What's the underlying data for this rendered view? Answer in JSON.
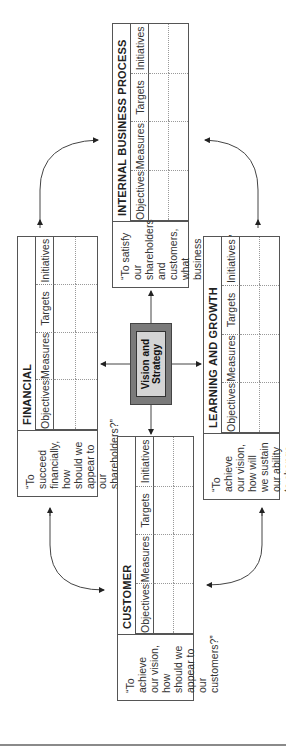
{
  "center": {
    "line1": "Vision and",
    "line2": "Strategy",
    "fill": "#7a7a7a",
    "inner_fill": "#d4d4d4"
  },
  "perspectives": {
    "financial": {
      "title": "FINANCIAL",
      "question": "“To succeed financially, how should we appear to our shareholders?”",
      "columns": [
        "Objectives",
        "Measures",
        "Targets",
        "Initiatives"
      ]
    },
    "internal": {
      "title": "INTERNAL BUSINESS PROCESS",
      "question": "“To satisfy our shareholders and customers, what business process must we excel at?”",
      "columns": [
        "Objectives",
        "Measures",
        "Targets",
        "Initiatives"
      ]
    },
    "customer": {
      "title": "CUSTOMER",
      "question": "“To achieve our vision, how should we appear to our customers?”",
      "columns": [
        "Objectives",
        "Measures",
        "Targets",
        "Initiatives"
      ]
    },
    "learning": {
      "title": "LEARNING AND GROWTH",
      "question": "“To achieve our vision, how will we sustain our ability to change and improve?”",
      "columns": [
        "Objectives",
        "Measures",
        "Targets",
        "Initiatives"
      ]
    }
  },
  "colors": {
    "line": "#555555",
    "arrow": "#333333",
    "rule": "#8a8a8a"
  }
}
